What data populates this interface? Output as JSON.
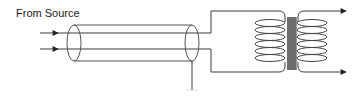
{
  "diagram": {
    "source_label": "From Source",
    "components": [
      {
        "id": "input-wire-top",
        "type": "wire",
        "direction": "right"
      },
      {
        "id": "input-wire-bottom",
        "type": "wire",
        "direction": "right"
      },
      {
        "id": "shielded-cable",
        "type": "coaxial-shield"
      },
      {
        "id": "shield-ground-lead",
        "type": "ground"
      },
      {
        "id": "primary-coil",
        "type": "coil",
        "turns": 6
      },
      {
        "id": "transformer-core",
        "type": "laminated-core"
      },
      {
        "id": "secondary-coil",
        "type": "coil",
        "turns": 6
      },
      {
        "id": "output-wire-top",
        "type": "wire",
        "direction": "right"
      },
      {
        "id": "output-wire-bottom",
        "type": "wire",
        "direction": "right"
      }
    ],
    "colors": {
      "line": "#3a3a3a",
      "core_fill": "#9a9a9a",
      "background": "#ffffff"
    }
  }
}
